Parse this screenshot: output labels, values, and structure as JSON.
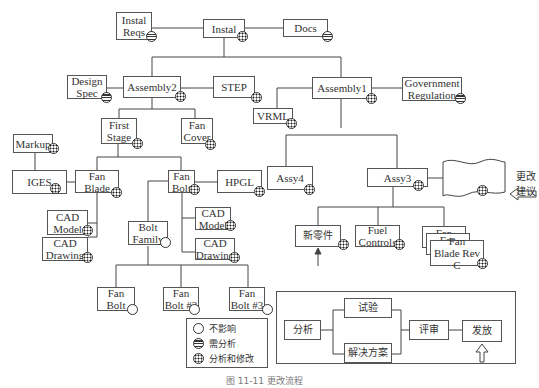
{
  "nodes": {
    "instal_reqs": "Instal\nReqs",
    "instal": "Instal",
    "docs": "Docs",
    "design_spec": "Design\nSpec",
    "assembly2": "Assembly2",
    "step": "STEP",
    "assembly1": "Assembly1",
    "government_regulation": "Government\nRegulation",
    "vrml": "VRML",
    "first_stage": "First\nStage",
    "fan_cover": "Fan\nCover",
    "markup": "Markup",
    "iges": "IGES",
    "fan_blade": "Fan\nBlade",
    "fan_bolt": "Fan\nBolt",
    "hpgl": "HPGL",
    "assy4": "Assy4",
    "assy3": "Assy3",
    "cad_model_1": "CAD\nModel",
    "cad_drawing_1": "CAD\nDrawing",
    "bolt_family": "Bolt\nFamily",
    "cad_model_2": "CAD\nModel",
    "cad_drawing_2": "CAD\nDrawing",
    "new_part": "新零件",
    "fuel_controls": "Fuel\nControls",
    "fan_stack_1": "Fan",
    "fan_stack_2": "Fan",
    "fan_blade_rev": "Fan\nBlade Rev C",
    "fan_bolt_a": "Fan\nBolt",
    "fan_bolt_2": "Fan\nBolt #2",
    "fan_bolt_3": "Fan\nBolt #3"
  },
  "change_request_label": "更改建议",
  "legend": {
    "items": [
      {
        "icon": "empty-circle-icon",
        "label": "不影响"
      },
      {
        "icon": "striped-circle-icon",
        "label": "需分析"
      },
      {
        "icon": "dotted-circle-icon",
        "label": "分析和修改"
      }
    ]
  },
  "flow": {
    "analyze": "分析",
    "test": "试验",
    "solution": "解决方案",
    "review": "评审",
    "release": "发放"
  },
  "caption": "图 11-11 更改流程"
}
